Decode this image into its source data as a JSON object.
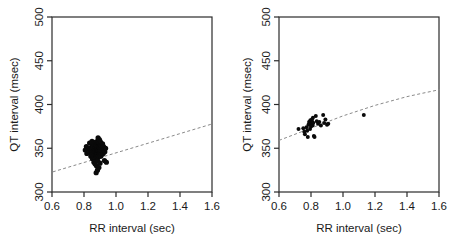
{
  "figure": {
    "background": "#ffffff",
    "point_color": "#0a0a0a",
    "line_color": "#8a8a8a",
    "axis_color": "#2b2b2b"
  },
  "panels": [
    {
      "id": "left",
      "ylabel": "QT interval (msec)",
      "ylabel_clipped": true,
      "xlabel": "RR interval (sec)"
    },
    {
      "id": "right",
      "ylabel": "QT interval (msec)",
      "xlabel": "RR interval (sec)"
    }
  ],
  "chart_data": [
    {
      "type": "scatter",
      "title": "",
      "xlabel": "RR interval (sec)",
      "ylabel": "QT interval (msec)",
      "xlim": [
        0.6,
        1.6
      ],
      "ylim": [
        300,
        500
      ],
      "xticks": [
        0.6,
        0.8,
        1.0,
        1.2,
        1.4,
        1.6
      ],
      "yticks": [
        300,
        350,
        400,
        450,
        500
      ],
      "xticklabels": [
        "0.6",
        "0.8",
        "1.0",
        "1.2",
        "1.4",
        "1.6"
      ],
      "yticklabels": [
        "300",
        "350",
        "400",
        "450",
        "500"
      ],
      "grid": false,
      "legend": "none",
      "series": [
        {
          "name": "QT vs RR (dense cluster)",
          "marker": "filled-circle",
          "color": "#0a0a0a",
          "points": [
            [
              0.815,
              352
            ],
            [
              0.828,
              349
            ],
            [
              0.835,
              356
            ],
            [
              0.84,
              345
            ],
            [
              0.843,
              341
            ],
            [
              0.845,
              351
            ],
            [
              0.848,
              347
            ],
            [
              0.85,
              358
            ],
            [
              0.851,
              343
            ],
            [
              0.853,
              338
            ],
            [
              0.855,
              350
            ],
            [
              0.856,
              354
            ],
            [
              0.857,
              346
            ],
            [
              0.858,
              341
            ],
            [
              0.859,
              352
            ],
            [
              0.86,
              348
            ],
            [
              0.861,
              344
            ],
            [
              0.862,
              356
            ],
            [
              0.863,
              340
            ],
            [
              0.864,
              350
            ],
            [
              0.865,
              347
            ],
            [
              0.866,
              353
            ],
            [
              0.866,
              343
            ],
            [
              0.867,
              349
            ],
            [
              0.868,
              345
            ],
            [
              0.869,
              355
            ],
            [
              0.87,
              351
            ],
            [
              0.87,
              339
            ],
            [
              0.871,
              348
            ],
            [
              0.872,
              344
            ],
            [
              0.873,
              352
            ],
            [
              0.874,
              347
            ],
            [
              0.874,
              357
            ],
            [
              0.875,
              342
            ],
            [
              0.876,
              350
            ],
            [
              0.876,
              346
            ],
            [
              0.877,
              354
            ],
            [
              0.878,
              349
            ],
            [
              0.878,
              340
            ],
            [
              0.879,
              345
            ],
            [
              0.88,
              352
            ],
            [
              0.88,
              348
            ],
            [
              0.881,
              356
            ],
            [
              0.881,
              343
            ],
            [
              0.882,
              350
            ],
            [
              0.882,
              346
            ],
            [
              0.883,
              353
            ],
            [
              0.883,
              341
            ],
            [
              0.884,
              349
            ],
            [
              0.884,
              345
            ],
            [
              0.885,
              358
            ],
            [
              0.885,
              352
            ],
            [
              0.886,
              347
            ],
            [
              0.886,
              343
            ],
            [
              0.887,
              350
            ],
            [
              0.887,
              355
            ],
            [
              0.888,
              346
            ],
            [
              0.888,
              340
            ],
            [
              0.889,
              351
            ],
            [
              0.889,
              348
            ],
            [
              0.89,
              344
            ],
            [
              0.89,
              354
            ],
            [
              0.891,
              349
            ],
            [
              0.891,
              342
            ],
            [
              0.892,
              352
            ],
            [
              0.892,
              347
            ],
            [
              0.893,
              357
            ],
            [
              0.893,
              345
            ],
            [
              0.894,
              350
            ],
            [
              0.894,
              341
            ],
            [
              0.895,
              353
            ],
            [
              0.895,
              348
            ],
            [
              0.896,
              344
            ],
            [
              0.896,
              356
            ],
            [
              0.897,
              350
            ],
            [
              0.897,
              346
            ],
            [
              0.898,
              352
            ],
            [
              0.898,
              342
            ],
            [
              0.899,
              349
            ],
            [
              0.899,
              355
            ],
            [
              0.9,
              345
            ],
            [
              0.9,
              351
            ],
            [
              0.901,
              347
            ],
            [
              0.901,
              358
            ],
            [
              0.902,
              343
            ],
            [
              0.902,
              350
            ],
            [
              0.903,
              354
            ],
            [
              0.903,
              346
            ],
            [
              0.904,
              352
            ],
            [
              0.905,
              348
            ],
            [
              0.905,
              341
            ],
            [
              0.906,
              356
            ],
            [
              0.907,
              350
            ],
            [
              0.908,
              345
            ],
            [
              0.909,
              353
            ],
            [
              0.91,
              348
            ],
            [
              0.911,
              343
            ],
            [
              0.912,
              351
            ],
            [
              0.914,
              347
            ],
            [
              0.916,
              355
            ],
            [
              0.918,
              350
            ],
            [
              0.92,
              344
            ],
            [
              0.922,
              352
            ],
            [
              0.925,
              348
            ],
            [
              0.928,
              336
            ],
            [
              0.93,
              346
            ],
            [
              0.935,
              350
            ],
            [
              0.94,
              334
            ],
            [
              0.862,
              334
            ],
            [
              0.87,
              332
            ],
            [
              0.878,
              330
            ],
            [
              0.885,
              336
            ],
            [
              0.893,
              328
            ],
            [
              0.9,
              333
            ],
            [
              0.876,
              322
            ],
            [
              0.884,
              325
            ],
            [
              0.808,
              348
            ],
            [
              0.818,
              344
            ],
            [
              0.888,
              362
            ],
            [
              0.896,
              360
            ]
          ]
        }
      ],
      "fit_line": {
        "style": "dashed",
        "color": "#8a8a8a",
        "description": "linear regression",
        "endpoints": [
          [
            0.605,
            323
          ],
          [
            1.605,
            378
          ]
        ]
      }
    },
    {
      "type": "scatter",
      "title": "",
      "xlabel": "RR interval (sec)",
      "ylabel": "QT interval (msec)",
      "xlim": [
        0.6,
        1.6
      ],
      "ylim": [
        300,
        500
      ],
      "xticks": [
        0.6,
        0.8,
        1.0,
        1.2,
        1.4,
        1.6
      ],
      "yticks": [
        300,
        350,
        400,
        450,
        500
      ],
      "xticklabels": [
        "0.6",
        "0.8",
        "1.0",
        "1.2",
        "1.4",
        "1.6"
      ],
      "yticklabels": [
        "300",
        "350",
        "400",
        "450",
        "500"
      ],
      "grid": false,
      "legend": "none",
      "series": [
        {
          "name": "QT vs RR (sparse)",
          "marker": "filled-circle",
          "color": "#0a0a0a",
          "points": [
            [
              0.722,
              372
            ],
            [
              0.752,
              373
            ],
            [
              0.758,
              369
            ],
            [
              0.762,
              366
            ],
            [
              0.772,
              374
            ],
            [
              0.776,
              370
            ],
            [
              0.78,
              363
            ],
            [
              0.784,
              377
            ],
            [
              0.788,
              380
            ],
            [
              0.792,
              378
            ],
            [
              0.794,
              372
            ],
            [
              0.796,
              382
            ],
            [
              0.798,
              379
            ],
            [
              0.8,
              375
            ],
            [
              0.802,
              381
            ],
            [
              0.804,
              378
            ],
            [
              0.806,
              383
            ],
            [
              0.808,
              380
            ],
            [
              0.81,
              376
            ],
            [
              0.812,
              385
            ],
            [
              0.814,
              379
            ],
            [
              0.818,
              364
            ],
            [
              0.822,
              363
            ],
            [
              0.83,
              387
            ],
            [
              0.836,
              381
            ],
            [
              0.844,
              378
            ],
            [
              0.852,
              380
            ],
            [
              0.862,
              376
            ],
            [
              0.876,
              388
            ],
            [
              0.882,
              379
            ],
            [
              0.89,
              383
            ],
            [
              0.9,
              377
            ],
            [
              0.908,
              378
            ],
            [
              1.13,
              388
            ]
          ]
        }
      ],
      "fit_line": {
        "style": "dashed",
        "color": "#8a8a8a",
        "description": "nonlinear (log/power) fit",
        "points": [
          [
            0.6,
            359
          ],
          [
            0.7,
            366
          ],
          [
            0.8,
            373
          ],
          [
            0.9,
            380
          ],
          [
            1.0,
            387
          ],
          [
            1.1,
            393
          ],
          [
            1.2,
            399
          ],
          [
            1.3,
            404
          ],
          [
            1.4,
            409
          ],
          [
            1.5,
            413
          ],
          [
            1.605,
            417
          ]
        ]
      }
    }
  ]
}
